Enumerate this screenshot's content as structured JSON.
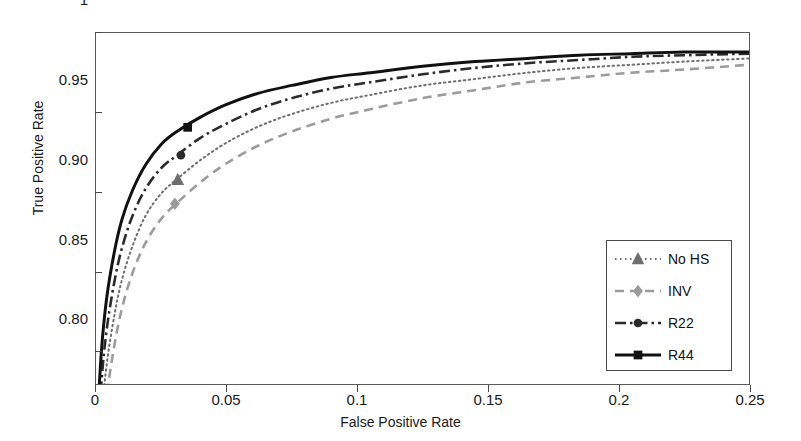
{
  "chart_data": {
    "type": "line",
    "title": "",
    "xlabel": "False Positive Rate",
    "ylabel": "True Positive Rate",
    "xlim": [
      0,
      0.25
    ],
    "ylim": [
      0.779,
      1.0
    ],
    "grid": false,
    "legend_position": "lower-right-inside",
    "xticks": [
      "0",
      "0.05",
      "0.1",
      "0.15",
      "0.2",
      "0.25"
    ],
    "xtick_values": [
      0,
      0.05,
      0.1,
      0.15,
      0.2,
      0.25
    ],
    "yticks": [
      "0.80",
      "0.85",
      "0.90",
      "0.95",
      "1"
    ],
    "ytick_values": [
      0.8,
      0.85,
      0.9,
      0.95,
      1.0
    ],
    "series": [
      {
        "name": "No HS",
        "color": "#6e6e6e",
        "linestyle": "dotted",
        "marker": "triangle",
        "marker_point": {
          "x": 0.0313,
          "y": 0.9075
        },
        "x": [
          0.0,
          0.002,
          0.004,
          0.007,
          0.01,
          0.014,
          0.019,
          0.025,
          0.031,
          0.04,
          0.05,
          0.062,
          0.075,
          0.09,
          0.105,
          0.125,
          0.145,
          0.165,
          0.185,
          0.205,
          0.225,
          0.25
        ],
        "y": [
          0.7,
          0.755,
          0.79,
          0.822,
          0.845,
          0.866,
          0.885,
          0.899,
          0.908,
          0.92,
          0.931,
          0.941,
          0.949,
          0.956,
          0.961,
          0.967,
          0.971,
          0.975,
          0.978,
          0.98,
          0.982,
          0.984
        ]
      },
      {
        "name": "INV",
        "color": "#9b9b9b",
        "linestyle": "dashed",
        "marker": "diamond",
        "marker_point": {
          "x": 0.0302,
          "y": 0.8925
        },
        "x": [
          0.0,
          0.002,
          0.004,
          0.007,
          0.01,
          0.014,
          0.019,
          0.025,
          0.031,
          0.04,
          0.05,
          0.062,
          0.075,
          0.09,
          0.105,
          0.125,
          0.145,
          0.165,
          0.185,
          0.205,
          0.225,
          0.25
        ],
        "y": [
          0.68,
          0.735,
          0.77,
          0.803,
          0.827,
          0.849,
          0.868,
          0.883,
          0.893,
          0.906,
          0.918,
          0.929,
          0.938,
          0.946,
          0.952,
          0.959,
          0.964,
          0.969,
          0.972,
          0.975,
          0.977,
          0.98
        ]
      },
      {
        "name": "R22",
        "color": "#2b2b2b",
        "linestyle": "dashdot",
        "marker": "circle",
        "marker_point": {
          "x": 0.0325,
          "y": 0.9231
        },
        "x": [
          0.0,
          0.002,
          0.004,
          0.007,
          0.01,
          0.014,
          0.019,
          0.025,
          0.031,
          0.04,
          0.05,
          0.062,
          0.075,
          0.09,
          0.105,
          0.125,
          0.145,
          0.165,
          0.185,
          0.205,
          0.225,
          0.25
        ],
        "y": [
          0.72,
          0.778,
          0.812,
          0.843,
          0.865,
          0.885,
          0.902,
          0.915,
          0.923,
          0.934,
          0.943,
          0.952,
          0.959,
          0.965,
          0.969,
          0.974,
          0.978,
          0.981,
          0.983,
          0.985,
          0.986,
          0.987
        ]
      },
      {
        "name": "R44",
        "color": "#111111",
        "linestyle": "solid",
        "marker": "square",
        "marker_point": {
          "x": 0.0351,
          "y": 0.9406
        },
        "x": [
          0.0,
          0.002,
          0.004,
          0.007,
          0.01,
          0.014,
          0.019,
          0.025,
          0.031,
          0.04,
          0.05,
          0.062,
          0.075,
          0.09,
          0.105,
          0.125,
          0.145,
          0.165,
          0.185,
          0.205,
          0.225,
          0.25
        ],
        "y": [
          0.74,
          0.798,
          0.832,
          0.862,
          0.883,
          0.901,
          0.917,
          0.93,
          0.938,
          0.947,
          0.955,
          0.962,
          0.967,
          0.972,
          0.975,
          0.979,
          0.982,
          0.984,
          0.986,
          0.987,
          0.988,
          0.988
        ]
      }
    ]
  },
  "axes": {
    "xlabel": "False Positive Rate",
    "ylabel": "True Positive Rate"
  },
  "legend": {
    "items": [
      {
        "label": "No HS"
      },
      {
        "label": "INV"
      },
      {
        "label": "R22"
      },
      {
        "label": "R44"
      }
    ]
  }
}
